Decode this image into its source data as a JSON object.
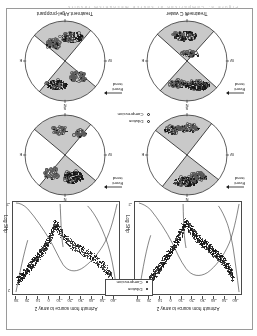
{
  "figure": {
    "cut_caption": "Figure 8.  Comparison of source mechanism results",
    "orientation_note": "rotated-180"
  },
  "scatter_panels": [
    {
      "id": "scatter-left",
      "xlabel": "Azimuth from source to array 2",
      "ylabel": "Log SHp",
      "xticks": [
        "30",
        "20",
        "10",
        "0",
        "-10",
        "-20",
        "-30",
        "-40",
        "-50",
        "-60"
      ],
      "yticks": [
        "2",
        "1",
        "0",
        "-1",
        "-2"
      ]
    },
    {
      "id": "scatter-right",
      "xlabel": "Azimuth from source to array 2",
      "ylabel": "Log SHp",
      "xticks": [
        "30",
        "20",
        "10",
        "0",
        "-10",
        "-20",
        "-30",
        "-40",
        "-50",
        "-60"
      ],
      "yticks": [
        "2",
        "1",
        "0",
        "-1",
        "-2"
      ]
    }
  ],
  "legends": [
    {
      "id": "legend-scatter",
      "items": [
        "Dilation",
        "Compression"
      ],
      "style": "boxed"
    },
    {
      "id": "legend-stereonet",
      "items": [
        "Dilation",
        "Compression"
      ],
      "style": "open-circle"
    }
  ],
  "stereonets": [
    {
      "id": "stereonet-water-top",
      "title": "",
      "cardinals": [
        "N",
        "E",
        "S",
        "W"
      ],
      "event_trend": "Event\ntrend"
    },
    {
      "id": "stereonet-gel-top",
      "title": "",
      "cardinals": [
        "N",
        "E",
        "S",
        "W"
      ],
      "event_trend": "Event\ntrend"
    },
    {
      "id": "stereonet-water-bottom",
      "title": "Treatment C water",
      "cardinals": [
        "N",
        "E",
        "S",
        "W"
      ],
      "event_trend": "Event\ntrend"
    },
    {
      "id": "stereonet-gel-bottom",
      "title": "Treatment A gel-proppant",
      "cardinals": [
        "N",
        "E",
        "S",
        "W"
      ],
      "event_trend": "Event\ntrend"
    }
  ],
  "labels": {
    "event_trend_line1": "Event",
    "event_trend_line2": "trend",
    "north": "N",
    "east": "E",
    "south": "S",
    "west": "W",
    "dilation": "Dilation",
    "compression": "Compression",
    "treatment_c": "Treatment C water",
    "treatment_a": "Treatment A gel-proppant",
    "azimuth": "Azimuth from source to array 2",
    "log_shp": "Log SHp"
  },
  "chart_data": {
    "type": "scatter",
    "title": "",
    "panels": [
      {
        "name": "Treatment C water",
        "xlabel": "Azimuth from source to array 2",
        "ylabel": "Log SHp",
        "xlim": [
          -65,
          35
        ],
        "ylim": [
          -2.2,
          2.2
        ],
        "xticks": [
          30,
          20,
          10,
          0,
          -10,
          -20,
          -30,
          -40,
          -50,
          -60
        ],
        "yticks": [
          2,
          1,
          0,
          -1,
          -2
        ],
        "grid": false,
        "series": [
          {
            "name": "Dilation / Compression events",
            "marker": "dot",
            "color": "#151515",
            "points": [
              [
                -58,
                1.45
              ],
              [
                -57,
                1.3
              ],
              [
                -56,
                1.22
              ],
              [
                -55,
                1.1
              ],
              [
                -54,
                1.02
              ],
              [
                -53,
                0.95
              ],
              [
                -52,
                0.86
              ],
              [
                -51,
                0.8
              ],
              [
                -50,
                0.74
              ],
              [
                -49,
                0.68
              ],
              [
                -48,
                0.62
              ],
              [
                -47,
                0.58
              ],
              [
                -46,
                0.52
              ],
              [
                -45,
                0.47
              ],
              [
                -44,
                0.42
              ],
              [
                -43,
                0.38
              ],
              [
                -42,
                0.33
              ],
              [
                -41,
                0.29
              ],
              [
                -40,
                0.25
              ],
              [
                -39,
                0.2
              ],
              [
                -38,
                0.16
              ],
              [
                -37,
                0.12
              ],
              [
                -36,
                0.08
              ],
              [
                -35,
                0.04
              ],
              [
                -34,
                0.0
              ],
              [
                -33,
                -0.04
              ],
              [
                -32,
                -0.08
              ],
              [
                -31,
                -0.12
              ],
              [
                -30,
                -0.16
              ],
              [
                -29,
                -0.2
              ],
              [
                -28,
                -0.25
              ],
              [
                -27,
                -0.3
              ],
              [
                -26,
                -0.35
              ],
              [
                -25,
                -0.4
              ],
              [
                -24,
                -0.46
              ],
              [
                -23,
                -0.52
              ],
              [
                -22,
                -0.58
              ],
              [
                -21,
                -0.65
              ],
              [
                -20,
                -0.73
              ],
              [
                -19,
                -0.8
              ],
              [
                -18,
                -0.88
              ],
              [
                -17,
                -0.95
              ],
              [
                -16,
                -1.02
              ],
              [
                -15,
                -1.1
              ],
              [
                -14,
                -1.05
              ],
              [
                -13,
                -0.95
              ],
              [
                -12,
                -0.85
              ],
              [
                -11,
                -0.72
              ],
              [
                -10,
                -0.6
              ],
              [
                -9,
                -0.5
              ],
              [
                -8,
                -0.4
              ],
              [
                -7,
                -0.3
              ],
              [
                -6,
                -0.2
              ],
              [
                -5,
                -0.12
              ],
              [
                -4,
                -0.04
              ],
              [
                -3,
                0.04
              ],
              [
                -2,
                0.12
              ],
              [
                -1,
                0.2
              ],
              [
                0,
                0.28
              ],
              [
                1,
                0.35
              ],
              [
                2,
                0.42
              ],
              [
                3,
                0.5
              ],
              [
                4,
                0.57
              ],
              [
                5,
                0.64
              ],
              [
                6,
                0.72
              ],
              [
                7,
                0.79
              ],
              [
                8,
                0.86
              ],
              [
                9,
                0.93
              ],
              [
                10,
                1.0
              ],
              [
                11,
                1.07
              ],
              [
                12,
                1.14
              ],
              [
                13,
                1.2
              ],
              [
                14,
                1.27
              ],
              [
                15,
                1.33
              ],
              [
                16,
                1.4
              ],
              [
                17,
                1.46
              ],
              [
                18,
                1.52
              ]
            ]
          }
        ],
        "reference_curves": [
          {
            "name": "theoretical-radiation-pattern",
            "color": "#1a1a1a"
          }
        ]
      },
      {
        "name": "Treatment A gel-proppant",
        "xlabel": "Azimuth from source to array 2",
        "ylabel": "Log SHp",
        "xlim": [
          -65,
          35
        ],
        "ylim": [
          -2.2,
          2.2
        ],
        "xticks": [
          30,
          20,
          10,
          0,
          -10,
          -20,
          -30,
          -40,
          -50,
          -60
        ],
        "yticks": [
          2,
          1,
          0,
          -1,
          -2
        ],
        "grid": false,
        "series": [
          {
            "name": "Dilation / Compression events",
            "marker": "dot",
            "color": "#151515",
            "points": [
              [
                -60,
                1.6
              ],
              [
                -58,
                1.4
              ],
              [
                -56,
                1.25
              ],
              [
                -54,
                1.1
              ],
              [
                -52,
                0.98
              ],
              [
                -50,
                0.88
              ],
              [
                -48,
                0.78
              ],
              [
                -46,
                0.7
              ],
              [
                -44,
                0.62
              ],
              [
                -42,
                0.55
              ],
              [
                -40,
                0.48
              ],
              [
                -38,
                0.41
              ],
              [
                -36,
                0.35
              ],
              [
                -34,
                0.29
              ],
              [
                -32,
                0.23
              ],
              [
                -30,
                0.17
              ],
              [
                -28,
                0.1
              ],
              [
                -26,
                0.04
              ],
              [
                -24,
                -0.03
              ],
              [
                -22,
                -0.1
              ],
              [
                -20,
                -0.18
              ],
              [
                -18,
                -0.27
              ],
              [
                -16,
                -0.37
              ],
              [
                -14,
                -0.48
              ],
              [
                -12,
                -0.6
              ],
              [
                -10,
                -0.75
              ],
              [
                -9,
                -0.85
              ],
              [
                -8,
                -0.95
              ],
              [
                -7,
                -1.05
              ],
              [
                -6,
                -1.0
              ],
              [
                -5,
                -0.85
              ],
              [
                -4,
                -0.7
              ],
              [
                -3,
                -0.55
              ],
              [
                -2,
                -0.42
              ],
              [
                -1,
                -0.3
              ],
              [
                0,
                -0.2
              ],
              [
                1,
                -0.1
              ],
              [
                2,
                -0.02
              ],
              [
                3,
                0.06
              ],
              [
                4,
                0.14
              ],
              [
                5,
                0.21
              ],
              [
                6,
                0.28
              ],
              [
                7,
                0.35
              ],
              [
                8,
                0.42
              ],
              [
                9,
                0.48
              ],
              [
                10,
                0.55
              ],
              [
                11,
                0.61
              ],
              [
                12,
                0.67
              ],
              [
                13,
                0.73
              ],
              [
                14,
                0.79
              ],
              [
                15,
                0.85
              ],
              [
                16,
                0.91
              ],
              [
                17,
                0.97
              ],
              [
                18,
                1.03
              ],
              [
                19,
                1.09
              ],
              [
                20,
                1.15
              ],
              [
                21,
                1.21
              ],
              [
                22,
                1.27
              ],
              [
                23,
                1.33
              ],
              [
                24,
                1.39
              ],
              [
                25,
                1.45
              ],
              [
                26,
                1.51
              ],
              [
                27,
                1.57
              ],
              [
                28,
                1.63
              ]
            ]
          }
        ],
        "reference_curves": [
          {
            "name": "theoretical-radiation-pattern",
            "color": "#1a1a1a"
          }
        ]
      }
    ]
  }
}
